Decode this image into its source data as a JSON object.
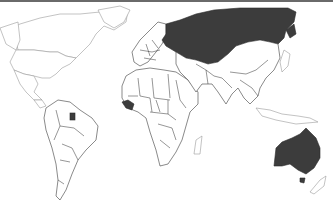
{
  "map": {
    "type": "world choropleth (binary highlight)",
    "highlight_color": "#3c3c3c",
    "base_color": "#ffffff",
    "border_color": "#2e2e2e",
    "highlighted_countries": [
      "Russia",
      "Australia",
      "Guinea",
      "Suriname"
    ]
  }
}
